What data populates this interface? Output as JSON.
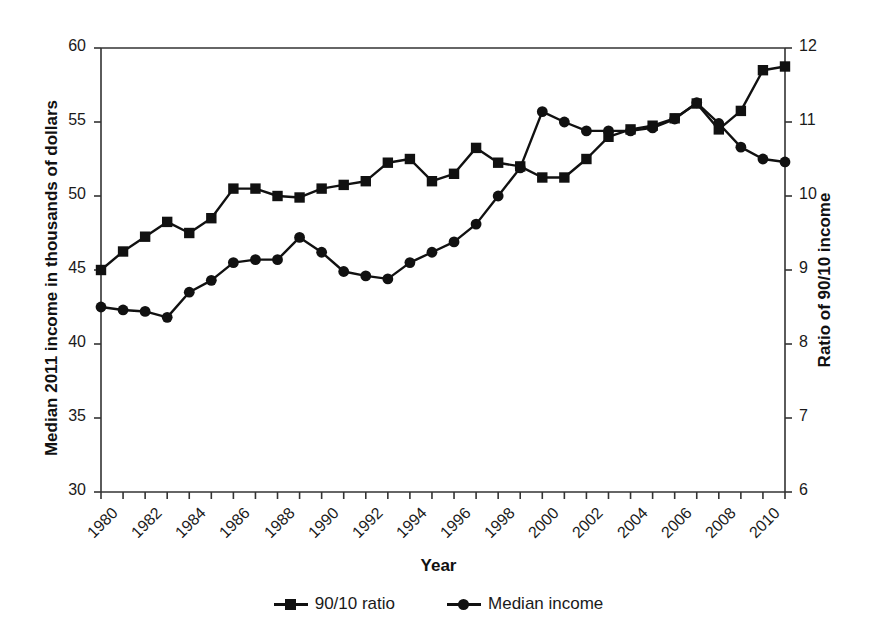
{
  "chart_data": {
    "type": "line",
    "title": "",
    "xlabel": "Year",
    "ylabel": "Median 2011 income in thousands of dollars",
    "ylabel_right": "Ratio of 90/10 income",
    "xlim": [
      1980,
      2011
    ],
    "ylim": [
      30,
      60
    ],
    "ylim_right": [
      6,
      12
    ],
    "grid": false,
    "legend_position": "bottom-center",
    "yticks": [
      30,
      35,
      40,
      45,
      50,
      55,
      60
    ],
    "yticks_right": [
      6,
      7,
      8,
      9,
      10,
      11,
      12
    ],
    "xticks": [
      1980,
      1982,
      1984,
      1986,
      1988,
      1990,
      1992,
      1994,
      1996,
      1998,
      2000,
      2002,
      2004,
      2006,
      2008,
      2010
    ],
    "x": [
      1980,
      1981,
      1982,
      1983,
      1984,
      1985,
      1986,
      1987,
      1988,
      1989,
      1990,
      1991,
      1992,
      1993,
      1994,
      1995,
      1996,
      1997,
      1998,
      1999,
      2000,
      2001,
      2002,
      2003,
      2004,
      2005,
      2006,
      2007,
      2008,
      2009,
      2010,
      2011
    ],
    "series": [
      {
        "name": "90/10 ratio",
        "axis": "right",
        "marker": "square",
        "values": [
          9.0,
          9.25,
          9.45,
          9.65,
          9.5,
          9.7,
          10.1,
          10.1,
          10.0,
          9.98,
          10.1,
          10.15,
          10.2,
          10.45,
          10.5,
          10.2,
          10.3,
          10.65,
          10.45,
          10.4,
          10.25,
          10.25,
          10.5,
          10.8,
          10.9,
          10.95,
          11.05,
          11.25,
          10.9,
          11.15,
          11.7,
          11.75
        ],
        "values_left_axis_equivalent": [
          45.0,
          46.2,
          47.3,
          48.3,
          47.5,
          48.5,
          50.4,
          50.4,
          50.1,
          49.9,
          50.5,
          50.8,
          50.9,
          52.2,
          52.5,
          51.0,
          51.5,
          53.2,
          52.2,
          52.0,
          51.3,
          51.2,
          51.8,
          52.5,
          54.5,
          54.6,
          54.8,
          55.3,
          54.3,
          55.8,
          58.5,
          58.8
        ]
      },
      {
        "name": "Median income",
        "axis": "left",
        "marker": "circle",
        "values": [
          42.5,
          42.3,
          42.2,
          41.8,
          43.5,
          44.3,
          45.5,
          45.7,
          45.7,
          47.2,
          46.2,
          44.9,
          44.6,
          44.4,
          45.5,
          46.2,
          46.9,
          48.1,
          50.0,
          51.9,
          55.7,
          55.0,
          54.4,
          54.4,
          54.4,
          54.6,
          55.2,
          56.3,
          54.9,
          53.3,
          52.5,
          52.3
        ]
      }
    ]
  },
  "axes": {
    "left_title": "Median 2011 income in thousands of dollars",
    "right_title": "Ratio of 90/10 income",
    "x_title": "Year"
  },
  "legend": {
    "items": [
      {
        "label": "90/10 ratio",
        "marker": "square"
      },
      {
        "label": "Median income",
        "marker": "circle"
      }
    ]
  },
  "colors": {
    "line": "#111111",
    "axis": "#333333",
    "background": "#ffffff"
  }
}
